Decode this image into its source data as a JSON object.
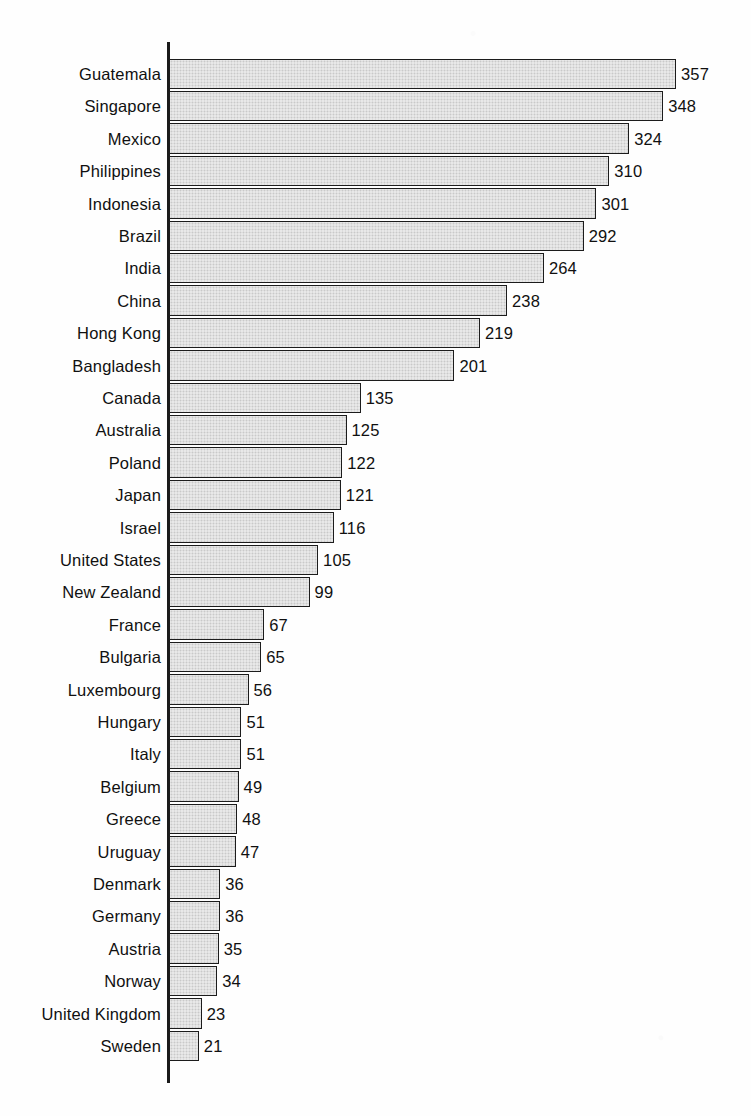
{
  "chart": {
    "type": "bar",
    "orientation": "horizontal",
    "axis_line_color": "#1a1a1a",
    "bar_fill_color": "#ededed",
    "bar_border_color": "#1c1c1c",
    "background_color": "#ffffff"
  },
  "chart_data": {
    "type": "bar",
    "title": "",
    "subtitle": "",
    "xlabel": "",
    "ylabel": "",
    "legend": [],
    "grid": false,
    "orientation": "horizontal",
    "xlim": [
      0,
      357
    ],
    "value_labels_shown": true,
    "sorted": "descending",
    "categories": [
      "Guatemala",
      "Singapore",
      "Mexico",
      "Philippines",
      "Indonesia",
      "Brazil",
      "India",
      "China",
      "Hong Kong",
      "Bangladesh",
      "Canada",
      "Australia",
      "Poland",
      "Japan",
      "Israel",
      "United States",
      "New Zealand",
      "France",
      "Bulgaria",
      "Luxembourg",
      "Hungary",
      "Italy",
      "Belgium",
      "Greece",
      "Uruguay",
      "Denmark",
      "Germany",
      "Austria",
      "Norway",
      "United Kingdom",
      "Sweden"
    ],
    "values": [
      357,
      348,
      324,
      310,
      301,
      292,
      264,
      238,
      219,
      201,
      135,
      125,
      122,
      121,
      116,
      105,
      99,
      67,
      65,
      56,
      51,
      51,
      49,
      48,
      47,
      36,
      36,
      35,
      34,
      23,
      21
    ]
  }
}
